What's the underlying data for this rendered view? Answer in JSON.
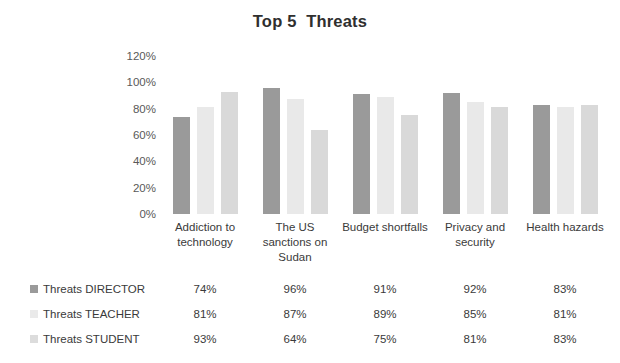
{
  "chart_data": {
    "type": "bar",
    "title": "Top 5  Threats",
    "xlabel": "",
    "ylabel": "",
    "ylim": [
      0,
      120
    ],
    "ytick_labels": [
      "120%",
      "100%",
      "80%",
      "60%",
      "40%",
      "20%",
      "0%"
    ],
    "ytick_values": [
      120,
      100,
      80,
      60,
      40,
      20,
      0
    ],
    "grid": false,
    "legend_position": "bottom-left-table",
    "categories": [
      "Addiction to technology",
      "The US sanctions on Sudan",
      "Budget shortfalls",
      "Privacy and security",
      "Health hazards"
    ],
    "series": [
      {
        "name": "Threats DIRECTOR",
        "color": "#9a9a9a",
        "values": [
          74,
          96,
          91,
          92,
          83
        ],
        "labels": [
          "74%",
          "96%",
          "91%",
          "92%",
          "83%"
        ]
      },
      {
        "name": "Threats TEACHER",
        "color": "#e9e9e9",
        "values": [
          81,
          87,
          89,
          85,
          81
        ],
        "labels": [
          "81%",
          "87%",
          "89%",
          "85%",
          "81%"
        ]
      },
      {
        "name": "Threats STUDENT",
        "color": "#d9d9d9",
        "values": [
          93,
          64,
          75,
          81,
          83
        ],
        "labels": [
          "93%",
          "64%",
          "75%",
          "81%",
          "83%"
        ]
      }
    ]
  }
}
